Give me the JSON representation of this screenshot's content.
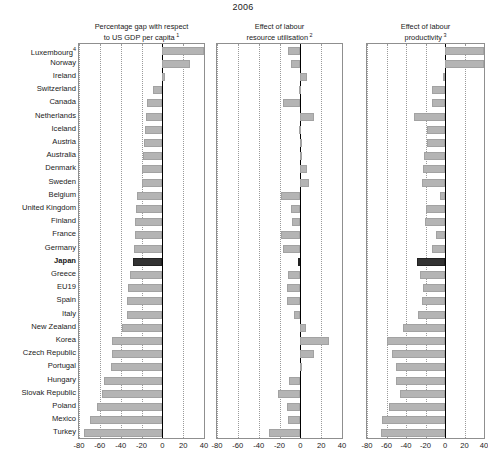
{
  "chart_data": {
    "type": "bar",
    "title": "2006",
    "orientation": "horizontal",
    "grid": true,
    "legend": false,
    "xlim": [
      -80,
      40
    ],
    "xticks": [
      -80,
      -60,
      -40,
      -20,
      0,
      20,
      40
    ],
    "xtick_labels": [
      "-80",
      "-60",
      "-40",
      "-20",
      "0",
      "20",
      "40"
    ],
    "xlabel": "",
    "ylabel": "",
    "highlight_category": "Japan",
    "categories": [
      "Luxembourg",
      "Norway",
      "Ireland",
      "Switzerland",
      "Canada",
      "Netherlands",
      "Iceland",
      "Austria",
      "Australia",
      "Denmark",
      "Sweden",
      "Belgium",
      "United Kingdom",
      "Finland",
      "France",
      "Germany",
      "Japan",
      "Greece",
      "EU19",
      "Spain",
      "Italy",
      "New Zealand",
      "Korea",
      "Czech Republic",
      "Portugal",
      "Hungary",
      "Slovak Republic",
      "Poland",
      "Mexico",
      "Turkey"
    ],
    "category_footnotes": {
      "Luxembourg": "4"
    },
    "panels": [
      {
        "title": "Percentage gap with respect\nto US GDP per capita",
        "footnote": "1",
        "values": [
          55,
          27,
          3,
          -9,
          -15,
          -16,
          -17,
          -18,
          -19,
          -20,
          -20,
          -24,
          -25,
          -26,
          -26,
          -27,
          -28,
          -31,
          -33,
          -34,
          -34,
          -39,
          -48,
          -48,
          -49,
          -56,
          -58,
          -63,
          -69,
          -75
        ]
      },
      {
        "title": "Effect of labour\nresource utilisation",
        "footnote": "2",
        "values": [
          -12,
          -9,
          6,
          -1,
          -17,
          13,
          -1,
          0,
          0,
          6,
          8,
          -19,
          -9,
          -8,
          -19,
          -17,
          -2,
          -12,
          -13,
          -13,
          -6,
          5,
          28,
          13,
          1,
          -11,
          -21,
          -13,
          -12,
          -30
        ]
      },
      {
        "title": "Effect of labour\nproductivity",
        "footnote": "3",
        "values": [
          46,
          42,
          -2,
          -13,
          -13,
          -32,
          -18,
          -18,
          -22,
          -23,
          -24,
          -5,
          -20,
          -21,
          -9,
          -13,
          -29,
          -26,
          -23,
          -24,
          -28,
          -43,
          -59,
          -54,
          -50,
          -50,
          -46,
          -57,
          -65,
          -66
        ]
      }
    ]
  }
}
